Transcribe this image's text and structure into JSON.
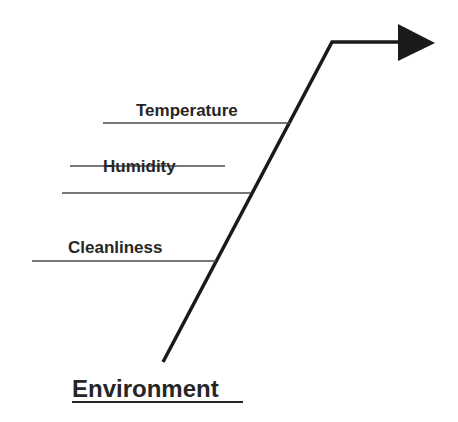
{
  "diagram": {
    "type": "fishbone-branch",
    "category": "Environment",
    "causes": [
      {
        "label": "Temperature",
        "struck": false
      },
      {
        "label": "Humidity",
        "struck": true
      },
      {
        "label": "Cleanliness",
        "struck": false
      }
    ],
    "colors": {
      "line": "#1a1a1a",
      "text": "#262626",
      "background": "#ffffff"
    }
  }
}
